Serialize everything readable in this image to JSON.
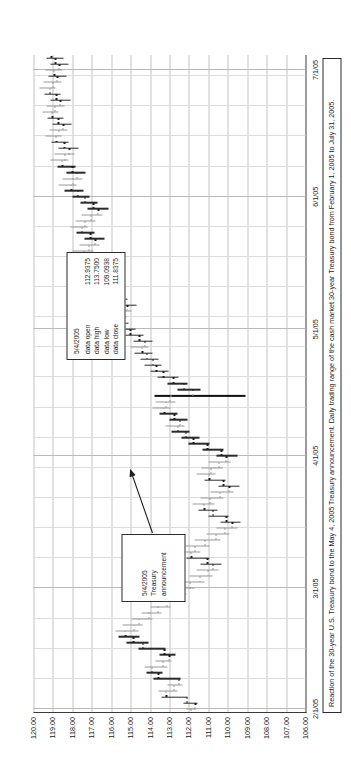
{
  "figure": {
    "title": "",
    "caption": "Reaction of the 30-year U.S. Treasury bond to the May 4, 2005 Treasury announcement.  Daily trading range of the cash market 30-year Treasury bond from February 1, 2005 to July 31, 2005."
  },
  "data_box": {
    "date": "5/4/2005",
    "rows": [
      {
        "label": "data open",
        "value": "112.9375"
      },
      {
        "label": "data high",
        "value": "113.7500"
      },
      {
        "label": "data low",
        "value": "109.0938"
      },
      {
        "label": "data close",
        "value": "111.8375"
      }
    ]
  },
  "annotation": {
    "date": "5/4/2005",
    "text": "Treasury announcement"
  },
  "chart_data": {
    "type": "ohlc",
    "title": "",
    "xlabel": "",
    "ylabel": "",
    "orientation": "rotated-90-ccw",
    "xlim": [
      "2/1/05",
      "7/31/05"
    ],
    "ylim": [
      106.0,
      120.0
    ],
    "grid": true,
    "legend": "none",
    "ytick_labels": [
      "120.00",
      "119.00",
      "118.00",
      "117.00",
      "116.00",
      "115.00",
      "114.00",
      "113.00",
      "112.00",
      "111.00",
      "110.00",
      "109.00",
      "108.00",
      "107.00",
      "106.00"
    ],
    "yticks": [
      120,
      119,
      118,
      117,
      116,
      115,
      114,
      113,
      112,
      111,
      110,
      109,
      108,
      107,
      106
    ],
    "xtick_labels": [
      "2/1/05",
      "3/1/05",
      "4/1/05",
      "5/1/05",
      "6/1/05",
      "7/1/05"
    ],
    "xticks": [
      0,
      20,
      42,
      63,
      85,
      106
    ],
    "highlight_date": "5/4/2005",
    "highlight": {
      "open": 112.9375,
      "high": 113.75,
      "low": 109.0938,
      "close": 111.8375
    },
    "bars": [
      {
        "i": 0,
        "o": 111.9,
        "h": 112.1,
        "l": 111.62,
        "c": 111.72
      },
      {
        "i": 1,
        "o": 111.72,
        "h": 112.3,
        "l": 111.55,
        "c": 112.15
      },
      {
        "i": 2,
        "o": 112.15,
        "h": 113.4,
        "l": 112.05,
        "c": 113.2
      },
      {
        "i": 3,
        "o": 113.2,
        "h": 113.55,
        "l": 112.6,
        "c": 112.8
      },
      {
        "i": 4,
        "o": 112.8,
        "h": 113.1,
        "l": 112.35,
        "c": 112.55
      },
      {
        "i": 5,
        "o": 112.55,
        "h": 113.8,
        "l": 112.45,
        "c": 113.6
      },
      {
        "i": 6,
        "o": 113.6,
        "h": 114.2,
        "l": 113.35,
        "c": 113.95
      },
      {
        "i": 7,
        "o": 113.95,
        "h": 114.3,
        "l": 113.1,
        "c": 113.35
      },
      {
        "i": 8,
        "o": 113.35,
        "h": 113.7,
        "l": 112.9,
        "c": 113.05
      },
      {
        "i": 9,
        "o": 113.05,
        "h": 113.5,
        "l": 112.7,
        "c": 113.3
      },
      {
        "i": 10,
        "o": 113.3,
        "h": 114.6,
        "l": 113.2,
        "c": 114.4
      },
      {
        "i": 11,
        "o": 114.4,
        "h": 115.2,
        "l": 114.1,
        "c": 114.9
      },
      {
        "i": 12,
        "o": 114.9,
        "h": 115.6,
        "l": 114.55,
        "c": 115.3
      },
      {
        "i": 13,
        "o": 115.3,
        "h": 115.8,
        "l": 114.6,
        "c": 114.85
      },
      {
        "i": 14,
        "o": 114.85,
        "h": 115.4,
        "l": 114.4,
        "c": 114.6
      },
      {
        "i": 15,
        "o": 114.6,
        "h": 114.95,
        "l": 113.85,
        "c": 114.1
      },
      {
        "i": 16,
        "o": 114.1,
        "h": 114.45,
        "l": 113.4,
        "c": 113.6
      },
      {
        "i": 17,
        "o": 113.6,
        "h": 114.0,
        "l": 112.95,
        "c": 113.15
      },
      {
        "i": 18,
        "o": 113.15,
        "h": 113.6,
        "l": 112.4,
        "c": 112.65
      },
      {
        "i": 19,
        "o": 112.65,
        "h": 113.0,
        "l": 112.1,
        "c": 112.3
      },
      {
        "i": 20,
        "o": 112.3,
        "h": 112.8,
        "l": 111.7,
        "c": 111.95
      },
      {
        "i": 21,
        "o": 111.95,
        "h": 112.4,
        "l": 111.2,
        "c": 111.45
      },
      {
        "i": 22,
        "o": 111.45,
        "h": 111.95,
        "l": 110.8,
        "c": 111.05
      },
      {
        "i": 23,
        "o": 111.05,
        "h": 111.6,
        "l": 110.5,
        "c": 110.8
      },
      {
        "i": 24,
        "o": 110.8,
        "h": 111.4,
        "l": 110.3,
        "c": 111.1
      },
      {
        "i": 25,
        "o": 111.1,
        "h": 112.1,
        "l": 110.95,
        "c": 111.9
      },
      {
        "i": 26,
        "o": 111.9,
        "h": 112.5,
        "l": 111.4,
        "c": 111.7
      },
      {
        "i": 27,
        "o": 111.7,
        "h": 112.2,
        "l": 110.95,
        "c": 111.2
      },
      {
        "i": 28,
        "o": 111.2,
        "h": 111.7,
        "l": 110.4,
        "c": 110.65
      },
      {
        "i": 29,
        "o": 110.65,
        "h": 111.1,
        "l": 109.9,
        "c": 110.15
      },
      {
        "i": 30,
        "o": 110.15,
        "h": 110.6,
        "l": 109.5,
        "c": 109.8
      },
      {
        "i": 31,
        "o": 109.8,
        "h": 110.4,
        "l": 109.35,
        "c": 110.1
      },
      {
        "i": 32,
        "o": 110.1,
        "h": 111.0,
        "l": 109.95,
        "c": 110.8
      },
      {
        "i": 33,
        "o": 110.8,
        "h": 111.5,
        "l": 110.55,
        "c": 111.25
      },
      {
        "i": 34,
        "o": 111.25,
        "h": 111.8,
        "l": 110.7,
        "c": 110.95
      },
      {
        "i": 35,
        "o": 110.95,
        "h": 111.4,
        "l": 110.2,
        "c": 110.45
      },
      {
        "i": 36,
        "o": 110.45,
        "h": 110.9,
        "l": 109.7,
        "c": 109.95
      },
      {
        "i": 37,
        "o": 109.95,
        "h": 110.5,
        "l": 109.4,
        "c": 110.25
      },
      {
        "i": 38,
        "o": 110.25,
        "h": 111.2,
        "l": 110.1,
        "c": 111.0
      },
      {
        "i": 39,
        "o": 111.0,
        "h": 111.6,
        "l": 110.65,
        "c": 110.9
      },
      {
        "i": 40,
        "o": 110.9,
        "h": 111.35,
        "l": 110.25,
        "c": 110.5
      },
      {
        "i": 41,
        "o": 110.5,
        "h": 111.0,
        "l": 109.85,
        "c": 110.1
      },
      {
        "i": 42,
        "o": 110.1,
        "h": 110.6,
        "l": 109.5,
        "c": 110.35
      },
      {
        "i": 43,
        "o": 110.35,
        "h": 111.3,
        "l": 110.2,
        "c": 111.1
      },
      {
        "i": 44,
        "o": 111.1,
        "h": 112.0,
        "l": 110.95,
        "c": 111.8
      },
      {
        "i": 45,
        "o": 111.8,
        "h": 112.4,
        "l": 111.45,
        "c": 112.2
      },
      {
        "i": 46,
        "o": 112.2,
        "h": 112.9,
        "l": 111.95,
        "c": 112.6
      },
      {
        "i": 47,
        "o": 112.6,
        "h": 113.2,
        "l": 112.25,
        "c": 112.5
      },
      {
        "i": 48,
        "o": 112.5,
        "h": 113.0,
        "l": 112.05,
        "c": 112.8
      },
      {
        "i": 49,
        "o": 112.8,
        "h": 113.5,
        "l": 112.6,
        "c": 113.3
      },
      {
        "i": 50,
        "o": 113.3,
        "h": 113.9,
        "l": 112.95,
        "c": 113.2
      },
      {
        "i": 51,
        "o": 113.2,
        "h": 113.7,
        "l": 112.7,
        "c": 113.0
      },
      {
        "i": 52,
        "o": 112.9375,
        "h": 113.75,
        "l": 109.0938,
        "c": 111.8375,
        "hi": true
      },
      {
        "i": 53,
        "o": 111.84,
        "h": 112.6,
        "l": 111.4,
        "c": 112.3
      },
      {
        "i": 54,
        "o": 112.3,
        "h": 113.1,
        "l": 112.05,
        "c": 112.85
      },
      {
        "i": 55,
        "o": 112.85,
        "h": 113.6,
        "l": 112.55,
        "c": 113.35
      },
      {
        "i": 56,
        "o": 113.35,
        "h": 114.0,
        "l": 113.05,
        "c": 113.7
      },
      {
        "i": 57,
        "o": 113.7,
        "h": 114.3,
        "l": 113.4,
        "c": 113.9
      },
      {
        "i": 58,
        "o": 113.9,
        "h": 114.5,
        "l": 113.55,
        "c": 114.2
      },
      {
        "i": 59,
        "o": 114.2,
        "h": 114.8,
        "l": 113.9,
        "c": 114.45
      },
      {
        "i": 60,
        "o": 114.45,
        "h": 115.0,
        "l": 114.1,
        "c": 114.3
      },
      {
        "i": 61,
        "o": 114.3,
        "h": 114.85,
        "l": 113.85,
        "c": 114.6
      },
      {
        "i": 62,
        "o": 114.6,
        "h": 115.3,
        "l": 114.35,
        "c": 115.05
      },
      {
        "i": 63,
        "o": 115.05,
        "h": 115.7,
        "l": 114.75,
        "c": 115.4
      },
      {
        "i": 64,
        "o": 115.4,
        "h": 116.0,
        "l": 115.1,
        "c": 115.65
      },
      {
        "i": 65,
        "o": 115.65,
        "h": 116.2,
        "l": 115.2,
        "c": 115.45
      },
      {
        "i": 66,
        "o": 115.45,
        "h": 115.95,
        "l": 114.95,
        "c": 115.2
      },
      {
        "i": 67,
        "o": 115.2,
        "h": 115.7,
        "l": 114.7,
        "c": 115.4
      },
      {
        "i": 68,
        "o": 115.4,
        "h": 116.1,
        "l": 115.15,
        "c": 115.9
      },
      {
        "i": 69,
        "o": 115.9,
        "h": 116.6,
        "l": 115.6,
        "c": 116.35
      },
      {
        "i": 70,
        "o": 116.35,
        "h": 117.0,
        "l": 116.05,
        "c": 116.7
      },
      {
        "i": 71,
        "o": 116.7,
        "h": 117.3,
        "l": 116.35,
        "c": 116.55
      },
      {
        "i": 72,
        "o": 116.55,
        "h": 117.1,
        "l": 116.1,
        "c": 116.8
      },
      {
        "i": 73,
        "o": 116.8,
        "h": 117.5,
        "l": 116.5,
        "c": 117.25
      },
      {
        "i": 74,
        "o": 117.25,
        "h": 117.9,
        "l": 116.95,
        "c": 117.6
      },
      {
        "i": 75,
        "o": 117.6,
        "h": 118.2,
        "l": 117.3,
        "c": 117.45
      },
      {
        "i": 76,
        "o": 117.45,
        "h": 118.0,
        "l": 116.9,
        "c": 117.15
      },
      {
        "i": 77,
        "o": 117.15,
        "h": 117.65,
        "l": 116.6,
        "c": 116.85
      },
      {
        "i": 78,
        "o": 116.85,
        "h": 117.4,
        "l": 116.35,
        "c": 117.1
      },
      {
        "i": 79,
        "o": 117.1,
        "h": 117.8,
        "l": 116.85,
        "c": 117.55
      },
      {
        "i": 80,
        "o": 117.55,
        "h": 118.1,
        "l": 117.2,
        "c": 117.35
      },
      {
        "i": 81,
        "o": 117.35,
        "h": 117.85,
        "l": 116.8,
        "c": 117.05
      },
      {
        "i": 82,
        "o": 117.05,
        "h": 117.55,
        "l": 116.45,
        "c": 116.7
      },
      {
        "i": 83,
        "o": 116.7,
        "h": 117.2,
        "l": 116.15,
        "c": 116.95
      },
      {
        "i": 84,
        "o": 116.95,
        "h": 117.6,
        "l": 116.7,
        "c": 117.4
      },
      {
        "i": 85,
        "o": 117.4,
        "h": 118.0,
        "l": 117.1,
        "c": 117.75
      },
      {
        "i": 86,
        "o": 117.75,
        "h": 118.4,
        "l": 117.45,
        "c": 118.1
      },
      {
        "i": 87,
        "o": 118.1,
        "h": 118.7,
        "l": 117.8,
        "c": 118.0
      },
      {
        "i": 88,
        "o": 118.0,
        "h": 118.5,
        "l": 117.5,
        "c": 117.8
      },
      {
        "i": 89,
        "o": 117.8,
        "h": 118.3,
        "l": 117.3,
        "c": 118.05
      },
      {
        "i": 90,
        "o": 118.05,
        "h": 118.75,
        "l": 117.85,
        "c": 118.55
      },
      {
        "i": 91,
        "o": 118.55,
        "h": 119.1,
        "l": 118.2,
        "c": 118.4
      },
      {
        "i": 92,
        "o": 118.4,
        "h": 118.9,
        "l": 117.9,
        "c": 118.2
      },
      {
        "i": 93,
        "o": 118.2,
        "h": 118.7,
        "l": 117.7,
        "c": 118.45
      },
      {
        "i": 94,
        "o": 118.45,
        "h": 119.05,
        "l": 118.2,
        "c": 118.85
      },
      {
        "i": 95,
        "o": 118.85,
        "h": 119.4,
        "l": 118.55,
        "c": 118.7
      },
      {
        "i": 96,
        "o": 118.7,
        "h": 119.2,
        "l": 118.25,
        "c": 118.5
      },
      {
        "i": 97,
        "o": 118.5,
        "h": 119.0,
        "l": 118.05,
        "c": 118.75
      },
      {
        "i": 98,
        "o": 118.75,
        "h": 119.3,
        "l": 118.45,
        "c": 119.05
      },
      {
        "i": 99,
        "o": 119.05,
        "h": 119.55,
        "l": 118.7,
        "c": 118.9
      },
      {
        "i": 100,
        "o": 118.9,
        "h": 119.35,
        "l": 118.4,
        "c": 118.65
      },
      {
        "i": 101,
        "o": 118.65,
        "h": 119.1,
        "l": 118.1,
        "c": 118.85
      },
      {
        "i": 102,
        "o": 118.85,
        "h": 119.45,
        "l": 118.6,
        "c": 119.2
      },
      {
        "i": 103,
        "o": 119.2,
        "h": 119.7,
        "l": 118.85,
        "c": 119.0
      },
      {
        "i": 104,
        "o": 119.0,
        "h": 119.5,
        "l": 118.55,
        "c": 118.8
      },
      {
        "i": 105,
        "o": 118.8,
        "h": 119.25,
        "l": 118.3,
        "c": 118.95
      },
      {
        "i": 106,
        "o": 118.95,
        "h": 119.4,
        "l": 118.5,
        "c": 118.7
      },
      {
        "i": 107,
        "o": 118.7,
        "h": 119.15,
        "l": 118.2,
        "c": 118.9
      },
      {
        "i": 108,
        "o": 118.9,
        "h": 119.35,
        "l": 118.45,
        "c": 119.1
      }
    ]
  }
}
